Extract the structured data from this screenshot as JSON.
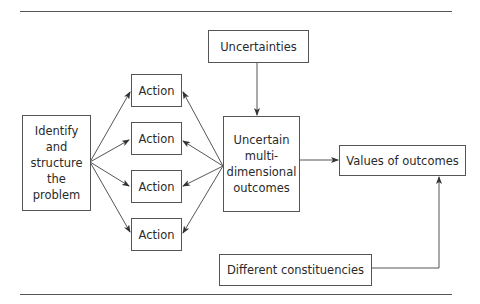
{
  "diagram": {
    "nodes": {
      "identify": "Identify and structure the problem",
      "identify_lines": [
        "Identify",
        "and",
        "structure",
        "the",
        "problem"
      ],
      "actions": [
        "Action",
        "Action",
        "Action",
        "Action"
      ],
      "uncertainties": "Uncertainties",
      "uncertain_outcomes_lines": [
        "Uncertain",
        "multi-",
        "dimensional",
        "outcomes"
      ],
      "values": "Values of outcomes",
      "constituencies": "Different constituencies"
    },
    "edges": [
      {
        "from": "Identify and structure the problem",
        "to": "Action 1"
      },
      {
        "from": "Identify and structure the problem",
        "to": "Action 2"
      },
      {
        "from": "Identify and structure the problem",
        "to": "Action 3"
      },
      {
        "from": "Identify and structure the problem",
        "to": "Action 4"
      },
      {
        "from": "Uncertain multi-dimensional outcomes",
        "to": "Action 1"
      },
      {
        "from": "Uncertain multi-dimensional outcomes",
        "to": "Action 2"
      },
      {
        "from": "Uncertain multi-dimensional outcomes",
        "to": "Action 3"
      },
      {
        "from": "Uncertain multi-dimensional outcomes",
        "to": "Action 4"
      },
      {
        "from": "Uncertainties",
        "to": "Uncertain multi-dimensional outcomes"
      },
      {
        "from": "Uncertain multi-dimensional outcomes",
        "to": "Values of outcomes"
      },
      {
        "from": "Different constituencies",
        "to": "Values of outcomes"
      }
    ],
    "colors": {
      "line": "#555555",
      "text": "#2a2a2a"
    }
  }
}
